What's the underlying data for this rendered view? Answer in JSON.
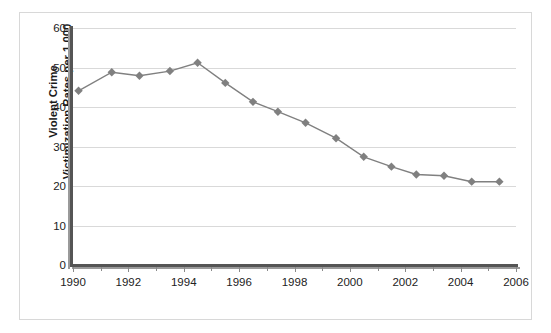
{
  "chart_data": {
    "type": "line",
    "title": "",
    "subtitle": "",
    "xlabel": "",
    "ylabel": "Violent Crime\nVictimization Rates per 1,000",
    "xlim": [
      1990,
      2006
    ],
    "ylim": [
      0,
      60
    ],
    "ytick_labels": [
      "0",
      "10",
      "20",
      "30",
      "40",
      "50",
      "60"
    ],
    "ytick_values": [
      0,
      10,
      20,
      30,
      40,
      50,
      60
    ],
    "xtick_labels": [
      "1990",
      "1992",
      "1994",
      "1996",
      "1998",
      "2000",
      "2002",
      "2004",
      "2006"
    ],
    "xtick_values": [
      1990,
      1992,
      1994,
      1996,
      1998,
      2000,
      2002,
      2004,
      2006
    ],
    "xminor_ticks": [
      1991,
      1993,
      1995,
      1997,
      1999,
      2001,
      2003,
      2005
    ],
    "grid": "horizontal",
    "legend": "none",
    "series": [
      {
        "name": "Violent Crime Victimization Rate",
        "color": "#808080",
        "marker": "diamond",
        "x": [
          1990.2,
          1991.4,
          1992.4,
          1993.5,
          1994.5,
          1995.5,
          1996.5,
          1997.4,
          1998.4,
          1999.5,
          2000.5,
          2001.5,
          2002.4,
          2003.4,
          2004.4,
          2005.4
        ],
        "values": [
          44.1,
          48.8,
          47.9,
          49.1,
          51.2,
          46.1,
          41.3,
          38.8,
          36.0,
          32.1,
          27.4,
          24.9,
          22.9,
          22.6,
          21.1,
          21.1
        ]
      }
    ]
  },
  "axes": {
    "y_axis_name": "violent-crime-rate-axis",
    "x_axis_name": "year-axis"
  }
}
